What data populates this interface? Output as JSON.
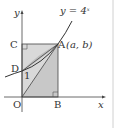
{
  "diagram": {
    "curve_label": "y = 4",
    "curve_exponent": "x",
    "axis_y_label": "y",
    "axis_x_label": "x",
    "points": {
      "O": "O",
      "A": "A",
      "A_coords": "(a, b)",
      "B": "B",
      "C": "C",
      "D": "D"
    },
    "d_value_label": "1",
    "colors": {
      "rect_fill": "#d9d9d9",
      "triangle_fill": "#c4c4c4",
      "stroke": "#333333",
      "divider": "#d0d0d0"
    }
  }
}
